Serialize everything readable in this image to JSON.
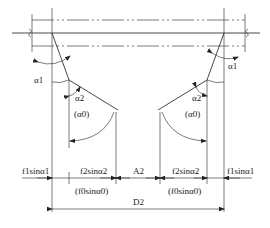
{
  "diagram": {
    "type": "engineering dimension drawing",
    "labels": {
      "alpha1_left": "α1",
      "alpha1_right": "α1",
      "alpha2_left": "α2",
      "alpha2_right": "α2",
      "alpha0_left": "(α0)",
      "alpha0_right": "(α0)",
      "dim_f1_left": "f1sinα1",
      "dim_f2_left": "f2sinα2",
      "dim_f0_left": "(f0sinα0)",
      "dim_A2": "A2",
      "dim_f2_right": "f2sinα2",
      "dim_f0_right": "(f0sinα0)",
      "dim_f1_right": "f1sinα1",
      "dim_D2": "D2"
    },
    "colors": {
      "line": "#333333",
      "background": "#ffffff"
    }
  }
}
